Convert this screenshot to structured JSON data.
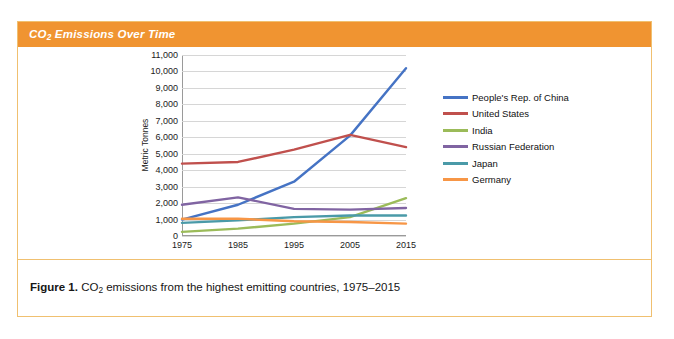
{
  "header": {
    "title_prefix": "CO",
    "title_sub": "2",
    "title_rest": " Emissions Over Time",
    "background_color": "#f09431",
    "text_color": "#ffffff"
  },
  "caption": {
    "figure_label": "Figure 1.",
    "text_prefix": " CO",
    "text_sub": "2",
    "text_rest": " emissions from the highest emitting countries, 1975–2015"
  },
  "card": {
    "border_color": "#f0c070",
    "background_color": "#ffffff"
  },
  "chart_data": {
    "type": "line",
    "title": "CO2 Emissions Over Time",
    "xlabel": "",
    "ylabel": "Metric Tonnes",
    "x": [
      1975,
      1985,
      1995,
      2005,
      2015
    ],
    "xtick_labels": [
      "1975",
      "1985",
      "1995",
      "2005",
      "2015"
    ],
    "ytick_labels": [
      "0",
      "1,000",
      "2,000",
      "3,000",
      "4,000",
      "5,000",
      "6,000",
      "7,000",
      "8,000",
      "9,000",
      "10,000",
      "11,000"
    ],
    "yticks": [
      0,
      1000,
      2000,
      3000,
      4000,
      5000,
      6000,
      7000,
      8000,
      9000,
      10000,
      11000
    ],
    "ylim": [
      0,
      11000
    ],
    "xlim": [
      1975,
      2015
    ],
    "grid": true,
    "legend_position": "right",
    "series": [
      {
        "name": "People's Rep. of China",
        "color": "#4573c4",
        "values": [
          1000,
          1900,
          3300,
          6100,
          10200
        ]
      },
      {
        "name": "United States",
        "color": "#c0504d",
        "values": [
          4400,
          4500,
          5250,
          6150,
          5400
        ]
      },
      {
        "name": "India",
        "color": "#9bbb59",
        "values": [
          250,
          450,
          750,
          1150,
          2300
        ]
      },
      {
        "name": "Russian Federation",
        "color": "#8064a2",
        "values": [
          1900,
          2350,
          1650,
          1600,
          1700
        ]
      },
      {
        "name": "Japan",
        "color": "#4a9aa8",
        "values": [
          800,
          950,
          1150,
          1250,
          1250
        ]
      },
      {
        "name": "Germany",
        "color": "#f79646",
        "values": [
          1050,
          1050,
          900,
          850,
          750
        ]
      }
    ]
  }
}
